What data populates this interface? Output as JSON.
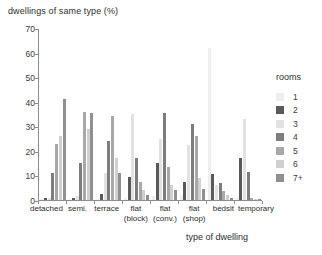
{
  "chart_data": {
    "type": "bar",
    "title": "",
    "ylabel": "dwellings of same type (%)",
    "xlabel": "type of dwelling",
    "ylim": [
      0,
      70
    ],
    "yticks": [
      0,
      10,
      20,
      30,
      40,
      50,
      60,
      70
    ],
    "grid": false,
    "legend_position": "right",
    "legend_title": "rooms",
    "categories": [
      {
        "label": "detached",
        "sub": ""
      },
      {
        "label": "semi.",
        "sub": ""
      },
      {
        "label": "terrace",
        "sub": ""
      },
      {
        "label": "flat",
        "sub": "(block)"
      },
      {
        "label": "flat",
        "sub": "(conv.)"
      },
      {
        "label": "flat",
        "sub": "(shop)"
      },
      {
        "label": "bedsit",
        "sub": ""
      },
      {
        "label": "temporary",
        "sub": ""
      }
    ],
    "series": [
      {
        "name": "1",
        "color": "#eeeeee",
        "values": [
          0.3,
          0.5,
          0.5,
          1.0,
          1.5,
          2.0,
          62.0,
          1.0
        ]
      },
      {
        "name": "2",
        "color": "#5a5a5a",
        "values": [
          1.0,
          1.0,
          2.5,
          9.5,
          15.0,
          7.5,
          10.5,
          17.0
        ]
      },
      {
        "name": "3",
        "color": "#e2e2e2",
        "values": [
          1.0,
          1.5,
          11.0,
          35.0,
          25.0,
          22.5,
          6.0,
          33.0
        ]
      },
      {
        "name": "4",
        "color": "#7d7d7d",
        "values": [
          11.0,
          15.0,
          24.0,
          17.0,
          35.5,
          31.0,
          7.0,
          11.5
        ]
      },
      {
        "name": "5",
        "color": "#a8a8a8",
        "values": [
          23.0,
          36.0,
          34.0,
          7.5,
          13.5,
          26.0,
          3.5,
          1.0
        ]
      },
      {
        "name": "6",
        "color": "#d0d0d0",
        "values": [
          26.0,
          29.0,
          17.0,
          4.0,
          6.0,
          9.0,
          2.0,
          0.6
        ]
      },
      {
        "name": "7+",
        "color": "#909090",
        "values": [
          41.0,
          35.5,
          11.0,
          2.0,
          4.0,
          4.5,
          1.0,
          0.5
        ]
      }
    ]
  }
}
